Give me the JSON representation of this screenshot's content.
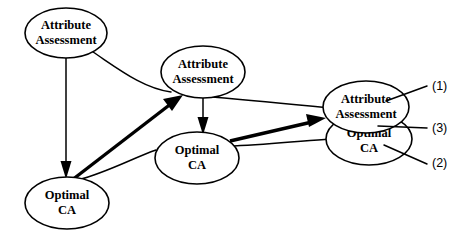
{
  "diagram": {
    "type": "node-link-diagram",
    "background_color": "#ffffff",
    "stroke_color": "#000000",
    "nodes": [
      {
        "id": "attribute-assessment-1",
        "line1": "Attribute",
        "line2": "Assessment",
        "cx": 66,
        "cy": 33,
        "rx": 41,
        "ry": 25
      },
      {
        "id": "attribute-assessment-2",
        "line1": "Attribute",
        "line2": "Assessment",
        "cx": 203,
        "cy": 72,
        "rx": 42,
        "ry": 26
      },
      {
        "id": "attribute-assessment-3",
        "line1": "Attribute",
        "line2": "Assessment",
        "cx": 366,
        "cy": 107,
        "rx": 43,
        "ry": 26
      },
      {
        "id": "optimal-ca-1",
        "line1": "Optimal",
        "line2": "CA",
        "cx": 67,
        "cy": 203,
        "rx": 42,
        "ry": 26
      },
      {
        "id": "optimal-ca-2",
        "line1": "Optimal",
        "line2": "CA",
        "cx": 197,
        "cy": 158,
        "rx": 42,
        "ry": 26
      },
      {
        "id": "optimal-ca-3",
        "line1": "Optimal",
        "line2": "CA",
        "cx": 369,
        "cy": 139,
        "rx": 43,
        "ry": 26
      }
    ],
    "callouts": [
      {
        "id": "callout-1",
        "label": "(1)",
        "x": 432,
        "y": 87
      },
      {
        "id": "callout-3",
        "label": "(3)",
        "x": 432,
        "y": 129
      },
      {
        "id": "callout-2",
        "label": "(2)",
        "x": 432,
        "y": 164
      }
    ],
    "edges": [
      {
        "id": "edge-aa1-to-oca1",
        "style": "thin-arrow",
        "from": "attribute-assessment-1",
        "to": "optimal-ca-1"
      },
      {
        "id": "edge-aa1-to-aa2",
        "style": "thin-curve",
        "from": "attribute-assessment-1",
        "to": "attribute-assessment-2"
      },
      {
        "id": "edge-oca1-to-aa2",
        "style": "thick-arrow",
        "from": "optimal-ca-1",
        "to": "attribute-assessment-2"
      },
      {
        "id": "edge-oca1-to-oca2",
        "style": "thin-curve",
        "from": "optimal-ca-1",
        "to": "optimal-ca-2"
      },
      {
        "id": "edge-aa2-to-oca2",
        "style": "thin-arrow",
        "from": "attribute-assessment-2",
        "to": "optimal-ca-2"
      },
      {
        "id": "edge-aa2-to-aa3",
        "style": "thin-curve",
        "from": "attribute-assessment-2",
        "to": "attribute-assessment-3"
      },
      {
        "id": "edge-oca2-to-aa3",
        "style": "thick-arrow",
        "from": "optimal-ca-2",
        "to": "attribute-assessment-3"
      },
      {
        "id": "edge-oca2-to-oca3",
        "style": "thin-curve",
        "from": "optimal-ca-2",
        "to": "optimal-ca-3"
      }
    ]
  }
}
